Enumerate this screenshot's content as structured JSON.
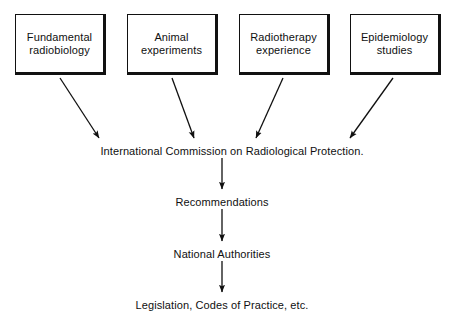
{
  "diagram": {
    "ink_color": "#101010",
    "background_color": "#ffffff",
    "sources": [
      {
        "id": "fundamental-radiobiology",
        "label": "Fundamental\nradiobiology",
        "x": 15,
        "y": 14,
        "width": 91,
        "height": 61
      },
      {
        "id": "animal-experiments",
        "label": "Animal\nexperiments",
        "x": 127,
        "y": 14,
        "width": 91,
        "height": 61
      },
      {
        "id": "radiotherapy-experience",
        "label": "Radiotherapy\nexperience",
        "x": 239,
        "y": 14,
        "width": 91,
        "height": 61
      },
      {
        "id": "epidemiology-studies",
        "label": "Epidemiology\nstudies",
        "x": 350,
        "y": 14,
        "width": 91,
        "height": 61
      }
    ],
    "chain": [
      {
        "id": "icrp",
        "label": "International Commission on Radiological Protection.",
        "cx": 232,
        "y": 145
      },
      {
        "id": "recommendations",
        "label": "Recommendations",
        "cx": 222,
        "y": 196
      },
      {
        "id": "national-authorities",
        "label": "National Authorities",
        "cx": 222,
        "y": 248
      },
      {
        "id": "legislation",
        "label": "Legislation, Codes of Practice, etc.",
        "cx": 222,
        "y": 299
      }
    ],
    "converging_arrows": [
      {
        "id": "arrow-radiobiology-to-icrp",
        "x1": 60,
        "y1": 78,
        "x2": 99,
        "y2": 138
      },
      {
        "id": "arrow-animal-to-icrp",
        "x1": 172,
        "y1": 78,
        "x2": 194,
        "y2": 138
      },
      {
        "id": "arrow-radiotherapy-to-icrp",
        "x1": 283,
        "y1": 78,
        "x2": 256,
        "y2": 138
      },
      {
        "id": "arrow-epidemiology-to-icrp",
        "x1": 393,
        "y1": 78,
        "x2": 350,
        "y2": 138
      }
    ],
    "vertical_arrows": [
      {
        "id": "arrow-icrp-to-recommendations",
        "x": 222,
        "y1": 158,
        "y2": 189
      },
      {
        "id": "arrow-recommendations-to-authorities",
        "x": 222,
        "y1": 209,
        "y2": 241
      },
      {
        "id": "arrow-authorities-to-legislation",
        "x": 222,
        "y1": 261,
        "y2": 292
      }
    ]
  }
}
